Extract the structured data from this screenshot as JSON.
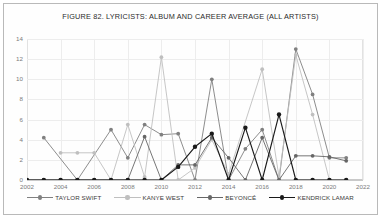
{
  "figure": {
    "title": "FIGURE 82. LYRICISTS: ALBUM AND CAREER AVERAGE (ALL ARTISTS)"
  },
  "colors": {
    "taylor_swift": "#808080",
    "kanye_west": "#bfbfbf",
    "beyonce": "#666666",
    "kendrick_lamar": "#1a1a1a",
    "grid": "#ededed",
    "axis": "#c9c9c9",
    "text": "#7b7b7b"
  },
  "chart_data": {
    "type": "line",
    "title": "FIGURE 82. LYRICISTS: ALBUM AND CAREER AVERAGE (ALL ARTISTS)",
    "xlabel": "",
    "ylabel": "",
    "xlim": [
      2002,
      2022
    ],
    "ylim": [
      0,
      14
    ],
    "ytick_step": 2,
    "yticks": [
      0,
      2,
      4,
      6,
      8,
      10,
      12,
      14
    ],
    "xticks": [
      2002,
      2004,
      2006,
      2008,
      2010,
      2012,
      2014,
      2016,
      2018,
      2020,
      2022
    ],
    "grid": true,
    "legend_position": "bottom",
    "series": [
      {
        "name": "TAYLOR SWIFT",
        "color": "#808080",
        "points": [
          {
            "x": 2003,
            "y": 4.2
          },
          {
            "x": 2005,
            "y": 0
          },
          {
            "x": 2007,
            "y": 5
          },
          {
            "x": 2008,
            "y": 2.2
          },
          {
            "x": 2009,
            "y": 5.5
          },
          {
            "x": 2010,
            "y": 4.5
          },
          {
            "x": 2011,
            "y": 4.6
          },
          {
            "x": 2012,
            "y": 0
          },
          {
            "x": 2013,
            "y": 10
          },
          {
            "x": 2014,
            "y": 0
          },
          {
            "x": 2015,
            "y": 3.1
          },
          {
            "x": 2016,
            "y": 5
          },
          {
            "x": 2017,
            "y": 0
          },
          {
            "x": 2018,
            "y": 13
          },
          {
            "x": 2019,
            "y": 8.5
          },
          {
            "x": 2020,
            "y": 2.2
          },
          {
            "x": 2021,
            "y": 2.2
          }
        ]
      },
      {
        "name": "KANYE WEST",
        "color": "#bfbfbf",
        "points": [
          {
            "x": 2004,
            "y": 2.7
          },
          {
            "x": 2005,
            "y": 2.7
          },
          {
            "x": 2006,
            "y": 2.7
          },
          {
            "x": 2007,
            "y": 0
          },
          {
            "x": 2008,
            "y": 5.5
          },
          {
            "x": 2009,
            "y": 0.3
          },
          {
            "x": 2010,
            "y": 12.2
          },
          {
            "x": 2011,
            "y": 0
          },
          {
            "x": 2012,
            "y": 1.2
          },
          {
            "x": 2013,
            "y": 4
          },
          {
            "x": 2014,
            "y": 0.6
          },
          {
            "x": 2016,
            "y": 11
          },
          {
            "x": 2017,
            "y": 0.3
          },
          {
            "x": 2018,
            "y": 12.4
          },
          {
            "x": 2019,
            "y": 6.5
          },
          {
            "x": 2020,
            "y": 0
          },
          {
            "x": 2021,
            "y": 0
          }
        ]
      },
      {
        "name": "BEYONCÉ",
        "color": "#666666",
        "points": [
          {
            "x": 2002,
            "y": 0
          },
          {
            "x": 2003,
            "y": 0
          },
          {
            "x": 2004,
            "y": 0
          },
          {
            "x": 2005,
            "y": 0
          },
          {
            "x": 2006,
            "y": 0
          },
          {
            "x": 2007,
            "y": 0
          },
          {
            "x": 2008,
            "y": 0
          },
          {
            "x": 2009,
            "y": 4.3
          },
          {
            "x": 2010,
            "y": 0
          },
          {
            "x": 2011,
            "y": 1.5
          },
          {
            "x": 2012,
            "y": 1.5
          },
          {
            "x": 2013,
            "y": 4.2
          },
          {
            "x": 2014,
            "y": 2.2
          },
          {
            "x": 2015,
            "y": 0
          },
          {
            "x": 2016,
            "y": 4.2
          },
          {
            "x": 2017,
            "y": 0
          },
          {
            "x": 2018,
            "y": 2.4
          },
          {
            "x": 2019,
            "y": 2.4
          },
          {
            "x": 2020,
            "y": 2.3
          },
          {
            "x": 2021,
            "y": 1.9
          }
        ]
      },
      {
        "name": "KENDRICK LAMAR",
        "color": "#1a1a1a",
        "points": [
          {
            "x": 2002,
            "y": 0
          },
          {
            "x": 2003,
            "y": 0
          },
          {
            "x": 2004,
            "y": 0
          },
          {
            "x": 2005,
            "y": 0
          },
          {
            "x": 2006,
            "y": 0
          },
          {
            "x": 2007,
            "y": 0
          },
          {
            "x": 2008,
            "y": 0
          },
          {
            "x": 2009,
            "y": 0
          },
          {
            "x": 2010,
            "y": 0
          },
          {
            "x": 2011,
            "y": 1.3
          },
          {
            "x": 2012,
            "y": 3.3
          },
          {
            "x": 2013,
            "y": 4.6
          },
          {
            "x": 2014,
            "y": 0
          },
          {
            "x": 2015,
            "y": 5.2
          },
          {
            "x": 2016,
            "y": 0
          },
          {
            "x": 2017,
            "y": 6.5
          },
          {
            "x": 2018,
            "y": 0
          },
          {
            "x": 2019,
            "y": 0
          },
          {
            "x": 2020,
            "y": 0
          },
          {
            "x": 2021,
            "y": 0
          }
        ]
      }
    ]
  }
}
